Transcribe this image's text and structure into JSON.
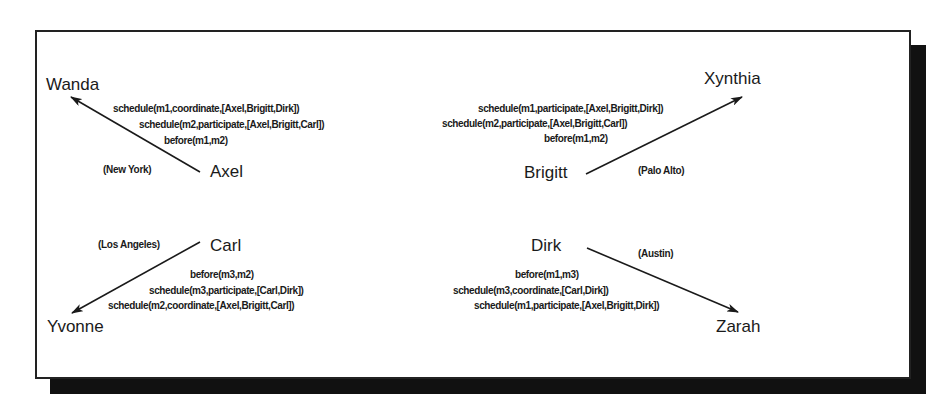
{
  "diagram": {
    "type": "agent-message-network",
    "nodes": {
      "wanda": "Wanda",
      "xynthia": "Xynthia",
      "yvonne": "Yvonne",
      "zarah": "Zarah",
      "axel": "Axel",
      "brigitt": "Brigitt",
      "carl": "Carl",
      "dirk": "Dirk"
    },
    "locations": {
      "axel": "(New York)",
      "brigitt": "(Palo Alto)",
      "carl": "(Los Angeles)",
      "dirk": "(Austin)"
    },
    "edges": [
      {
        "from": "Axel",
        "to": "Wanda",
        "messages": [
          "schedule(m1,coordinate,[Axel,Brigitt,Dirk])",
          "schedule(m2,participate,[Axel,Brigitt,Carl])",
          "before(m1,m2)"
        ]
      },
      {
        "from": "Brigitt",
        "to": "Xynthia",
        "messages": [
          "schedule(m1,participate,[Axel,Brigitt,Dirk])",
          "schedule(m2,participate,[Axel,Brigitt,Carl])",
          "before(m1,m2)"
        ]
      },
      {
        "from": "Carl",
        "to": "Yvonne",
        "messages": [
          "before(m3,m2)",
          "schedule(m3,participate,[Carl,Dirk])",
          "schedule(m2,coordinate,[Axel,Brigitt,Carl])"
        ]
      },
      {
        "from": "Dirk",
        "to": "Zarah",
        "messages": [
          "before(m1,m3)",
          "schedule(m3,coordinate,[Carl,Dirk])",
          "schedule(m1,participate,[Axel,Brigitt,Dirk])"
        ]
      }
    ],
    "colors": {
      "ink": "#1a1a1a",
      "shadow": "#111111",
      "background": "#ffffff"
    }
  }
}
